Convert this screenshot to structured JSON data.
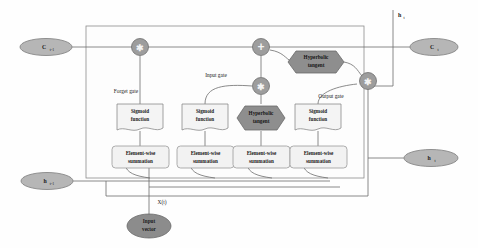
{
  "diagram": {
    "type": "block-diagram",
    "canvas": {
      "width": 478,
      "height": 248
    },
    "colors": {
      "wire": "#6d6d6d",
      "cell_border": "#8d8d8d",
      "node_fill": "#9d9d9d",
      "hex_fill": "#8e8e8e",
      "ellipse_light": "#b6b6b6",
      "ellipse_dark": "#8c8c8c",
      "doc_fill": "#f4f4f4",
      "text": "#1a1a1a"
    }
  },
  "inputs": {
    "cell_state_prev": {
      "label": "C",
      "sub": "t-1",
      "name": "previous-cell-state"
    },
    "hidden_prev": {
      "label": "h",
      "sub": "t-1",
      "name": "previous-hidden-state"
    },
    "input_vector": {
      "label_line1": "Input",
      "label_line2": "vector",
      "name": "input-vector"
    },
    "input_signal": {
      "label": "X(t)",
      "name": "input-signal-label"
    }
  },
  "outputs": {
    "cell_state_next": {
      "label": "C",
      "sub": "t",
      "name": "next-cell-state"
    },
    "hidden_next": {
      "label": "h",
      "sub": "t",
      "name": "next-hidden-state"
    },
    "hidden_top": {
      "label": "h",
      "sub": "t",
      "name": "hidden-state-top-branch"
    }
  },
  "gates": [
    {
      "id": "forget",
      "label": "Forget gate"
    },
    {
      "id": "input",
      "label": "Input gate"
    },
    {
      "id": "output",
      "label": "Output gate"
    }
  ],
  "activations": [
    {
      "id": "sigmoid-forget",
      "line1": "Sigmoid",
      "line2": "function",
      "shape": "document"
    },
    {
      "id": "sigmoid-input",
      "line1": "Sigmoid",
      "line2": "function",
      "shape": "document"
    },
    {
      "id": "tanh-candidate",
      "line1": "Hyperbolic",
      "line2": "tangent",
      "shape": "hexagon"
    },
    {
      "id": "sigmoid-output",
      "line1": "Sigmoid",
      "line2": "function",
      "shape": "document"
    },
    {
      "id": "tanh-output",
      "line1": "Hyperbolic",
      "line2": "tangent",
      "shape": "hexagon"
    }
  ],
  "summations": [
    {
      "id": "sum-forget",
      "line1": "Element-wise",
      "line2": "summation"
    },
    {
      "id": "sum-input",
      "line1": "Element-wise",
      "line2": "summation"
    },
    {
      "id": "sum-candidate",
      "line1": "Element-wise",
      "line2": "summation"
    },
    {
      "id": "sum-output",
      "line1": "Element-wise",
      "line2": "summation"
    }
  ],
  "operators": [
    {
      "id": "mult-forget",
      "glyph": "✱",
      "op": "multiply"
    },
    {
      "id": "add-cell",
      "glyph": "+",
      "op": "add"
    },
    {
      "id": "mult-input",
      "glyph": "✱",
      "op": "multiply"
    },
    {
      "id": "mult-output",
      "glyph": "✱",
      "op": "multiply"
    }
  ]
}
